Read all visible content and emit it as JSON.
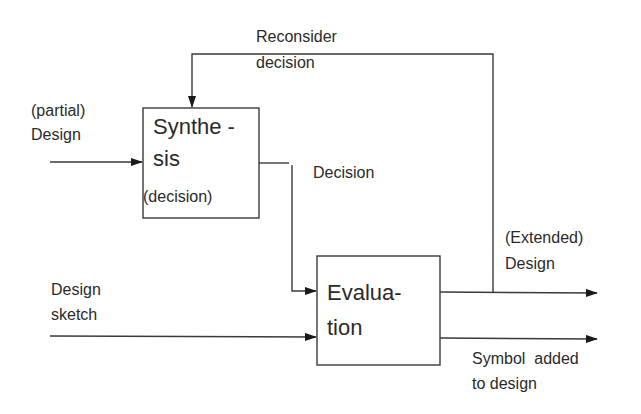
{
  "colors": {
    "background": "#ffffff",
    "line": "#3a3a3a",
    "text": "#2a2a2a"
  },
  "nodes": {
    "synthesis": {
      "label_line1": "Synthe -",
      "label_line2": "sis",
      "sublabel": "(decision)"
    },
    "evaluation": {
      "label_line1": "Evalua-",
      "label_line2": "tion"
    }
  },
  "edges": {
    "partial_design_in": {
      "label_line1": "(partial)",
      "label_line2": "Design"
    },
    "reconsider_feedback": {
      "label_line1": "Reconsider",
      "label_line2": "decision"
    },
    "decision": {
      "label": "Decision"
    },
    "design_sketch_in": {
      "label_line1": "Design",
      "label_line2": "sketch"
    },
    "extended_design_out": {
      "label_line1": "(Extended)",
      "label_line2": "Design"
    },
    "symbol_added_out": {
      "label_line1": "Symbol  added",
      "label_line2": "to design"
    }
  }
}
